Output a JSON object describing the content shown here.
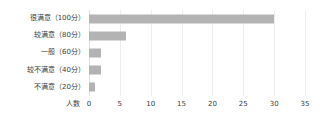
{
  "chart_data": {
    "type": "bar",
    "orientation": "horizontal",
    "title": "",
    "xlabel": "人数",
    "ylabel": "",
    "categories": [
      "很满意（100分）",
      "较满意（80分）",
      "一般（60分）",
      "较不满意（40分）",
      "不满意（20分）"
    ],
    "values": [
      30,
      6,
      2,
      2,
      1
    ],
    "xlim": [
      0,
      35
    ],
    "xticks": [
      0,
      5,
      10,
      15,
      20,
      25,
      30,
      35
    ],
    "xtick_labels": [
      "0",
      "5",
      "10",
      "15",
      "20",
      "25",
      "30",
      "35"
    ],
    "grid": true,
    "grid_axis": "x",
    "legend": false,
    "bar_color": "#b3b3b3",
    "grid_color": "#ededed",
    "text_color": "#3c3c3c",
    "background": "#ffffff"
  }
}
